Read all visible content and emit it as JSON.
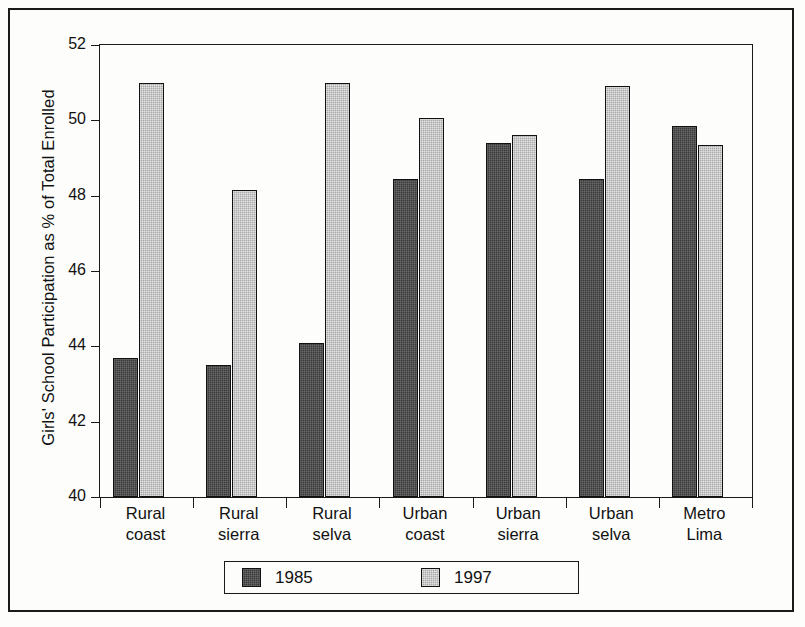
{
  "chart_data": {
    "type": "bar",
    "title": "",
    "subtitle": "",
    "xlabel": "",
    "ylabel": "Girls' School Participation as % of Total Enrolled",
    "ylim": [
      40,
      52
    ],
    "yticks": [
      40,
      42,
      44,
      46,
      48,
      50,
      52
    ],
    "ytick_labels": [
      "40",
      "42",
      "44",
      "46",
      "48",
      "50",
      "52"
    ],
    "grid": false,
    "legend_position": "bottom",
    "categories": [
      "Rural coast",
      "Rural sierra",
      "Rural selva",
      "Urban coast",
      "Urban sierra",
      "Urban selva",
      "Metro Lima"
    ],
    "category_lines": [
      [
        "Rural",
        "coast"
      ],
      [
        "Rural",
        "sierra"
      ],
      [
        "Rural",
        "selva"
      ],
      [
        "Urban",
        "coast"
      ],
      [
        "Urban",
        "sierra"
      ],
      [
        "Urban",
        "selva"
      ],
      [
        "Metro",
        "Lima"
      ]
    ],
    "series": [
      {
        "name": "1985",
        "color": "#3a3a3a",
        "values": [
          43.7,
          43.5,
          44.1,
          48.45,
          49.4,
          48.45,
          49.85
        ]
      },
      {
        "name": "1997",
        "color": "#a8a8a8",
        "values": [
          51.0,
          48.15,
          51.0,
          50.05,
          49.6,
          50.9,
          49.35
        ]
      }
    ]
  },
  "legend": {
    "items": [
      {
        "label": "1985",
        "color": "#3a3a3a"
      },
      {
        "label": "1997",
        "color": "#a8a8a8"
      }
    ]
  }
}
